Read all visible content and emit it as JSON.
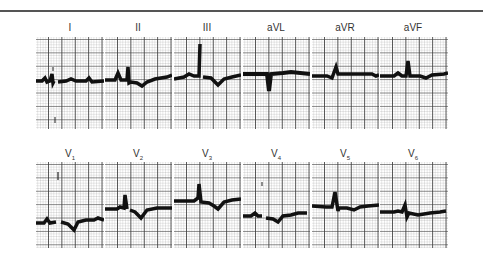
{
  "figure": {
    "type": "12-lead electrocardiogram",
    "rows": [
      {
        "leads": [
          {
            "name": "I",
            "label": "I",
            "sub": ""
          },
          {
            "name": "II",
            "label": "II",
            "sub": ""
          },
          {
            "name": "III",
            "label": "III",
            "sub": ""
          },
          {
            "name": "aVL",
            "label": "aVL",
            "sub": ""
          },
          {
            "name": "aVR",
            "label": "aVR",
            "sub": ""
          },
          {
            "name": "aVF",
            "label": "aVF",
            "sub": ""
          }
        ]
      },
      {
        "leads": [
          {
            "name": "V1",
            "label": "V",
            "sub": "1"
          },
          {
            "name": "V2",
            "label": "V",
            "sub": "2"
          },
          {
            "name": "V3",
            "label": "V",
            "sub": "3"
          },
          {
            "name": "V4",
            "label": "V",
            "sub": "4"
          },
          {
            "name": "V5",
            "label": "V",
            "sub": "5"
          },
          {
            "name": "V6",
            "label": "V",
            "sub": "6"
          }
        ]
      }
    ],
    "colors": {
      "trace": "#111111",
      "grid_major": "#3c3c3c",
      "grid_minor": "#b4b4b4",
      "rule": "#555555"
    }
  }
}
